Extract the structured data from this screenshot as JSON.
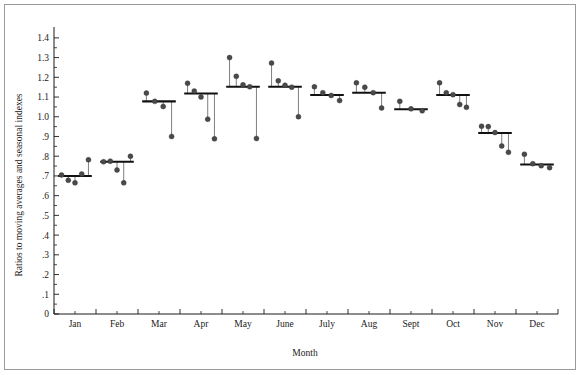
{
  "chart_data": {
    "type": "scatter",
    "title": "",
    "subtitle": "",
    "xlabel": "Month",
    "ylabel": "Ratios to moving averages and seasonal indexes",
    "categories": [
      "Jan",
      "Feb",
      "Mar",
      "Apr",
      "May",
      "June",
      "July",
      "Aug",
      "Sept",
      "Oct",
      "Nov",
      "Dec"
    ],
    "ylim": [
      0,
      1.45
    ],
    "ytick_values": [
      0,
      0.1,
      0.2,
      0.3,
      0.4,
      0.5,
      0.6,
      0.7,
      0.8,
      0.9,
      1.0,
      1.1,
      1.2,
      1.3,
      1.4
    ],
    "ytick_labels": [
      "0",
      ".1",
      ".2",
      ".3",
      ".4",
      ".5",
      ".6",
      ".7",
      ".8",
      ".9",
      "1.0",
      "1.1",
      "1.2",
      "1.3",
      "1.4"
    ],
    "grid": false,
    "legend": null,
    "series": [
      {
        "name": "Seasonal index (monthly mean level)",
        "render": "horizontal-mean-line",
        "values": [
          0.7,
          0.772,
          1.078,
          1.118,
          1.152,
          1.152,
          1.11,
          1.122,
          1.038,
          1.11,
          0.918,
          0.758
        ]
      },
      {
        "name": "Ratios to moving average (individual year observations)",
        "render": "points-with-stems",
        "points_by_month": {
          "Jan": [
            0.705,
            0.678,
            0.665,
            0.71,
            0.782
          ],
          "Feb": [
            0.772,
            0.775,
            0.73,
            0.665,
            0.8
          ],
          "Mar": [
            1.12,
            1.078,
            1.052,
            0.9
          ],
          "Apr": [
            1.17,
            1.13,
            1.1,
            0.988,
            0.888
          ],
          "May": [
            1.3,
            1.205,
            1.162,
            1.152,
            0.89
          ],
          "June": [
            1.272,
            1.182,
            1.16,
            1.15,
            1.0
          ],
          "July": [
            1.152,
            1.122,
            1.108,
            1.082
          ],
          "Aug": [
            1.172,
            1.15,
            1.122,
            1.045
          ],
          "Sept": [
            1.078,
            1.04,
            1.03
          ],
          "Oct": [
            1.172,
            1.122,
            1.112,
            1.062,
            1.048
          ],
          "Nov": [
            0.952,
            0.95,
            0.92,
            0.852,
            0.82
          ],
          "Dec": [
            0.81,
            0.762,
            0.752,
            0.742
          ]
        }
      }
    ],
    "annotations": []
  },
  "colors": {
    "frame": "#9a9a9a",
    "axis": "#1a1a1a",
    "mean_line": "#111111",
    "point_fill": "#4a4a4a",
    "stem": "#6f6f6f",
    "background": "#ffffff"
  }
}
